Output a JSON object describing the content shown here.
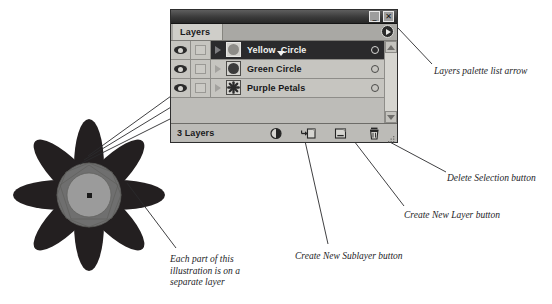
{
  "palette": {
    "window_title": "",
    "tab_label": "Layers",
    "minimize_label": "_",
    "close_label": "✕",
    "menu_icon": "palette-menu-arrow-icon",
    "status_text": "3 Layers",
    "layers": [
      {
        "name": "Yellow Circle",
        "selected": true,
        "visible": true,
        "locked": false,
        "thumb": "circle-light",
        "has_name_caret": true,
        "color_swatch": "#b5b4b0"
      },
      {
        "name": "Green Circle",
        "selected": false,
        "visible": true,
        "locked": false,
        "thumb": "circle-dark",
        "has_name_caret": false,
        "color_swatch": "#1e1e1e"
      },
      {
        "name": "Purple Petals",
        "selected": false,
        "visible": true,
        "locked": false,
        "thumb": "star-dark",
        "has_name_caret": false,
        "color_swatch": "#1e1e1e"
      }
    ],
    "footer_buttons": [
      {
        "name": "make-clipping-mask-button",
        "icon": "half-filled-circle-icon"
      },
      {
        "name": "create-new-sublayer-button",
        "icon": "arrow-into-page-icon"
      },
      {
        "name": "create-new-layer-button",
        "icon": "new-page-icon"
      },
      {
        "name": "delete-selection-button",
        "icon": "trash-can-icon"
      }
    ],
    "scrollbar": {
      "up_icon": "chevron-up-icon",
      "down_icon": "chevron-down-icon"
    }
  },
  "callouts": {
    "list_arrow": "Layers palette list arrow",
    "delete_selection": "Delete Selection button",
    "create_new_layer": "Create New Layer button",
    "create_new_sublayer": "Create New Sublayer button",
    "each_part": "Each part of this\nillustration is on a\nseparate layer"
  },
  "illustration": {
    "name": "eight-petal-flower",
    "petal_count": 8,
    "petal_color": "#231f20",
    "outer_circle_color": "#6f6f6f",
    "inner_circle_color": "#9b9b9b"
  },
  "colors": {
    "page_background": "#ffffff",
    "palette_background": "#bdbcb8",
    "titlebar": "#3a3a3a",
    "selected_row": "#2a2a2c",
    "text": "#17171a"
  }
}
